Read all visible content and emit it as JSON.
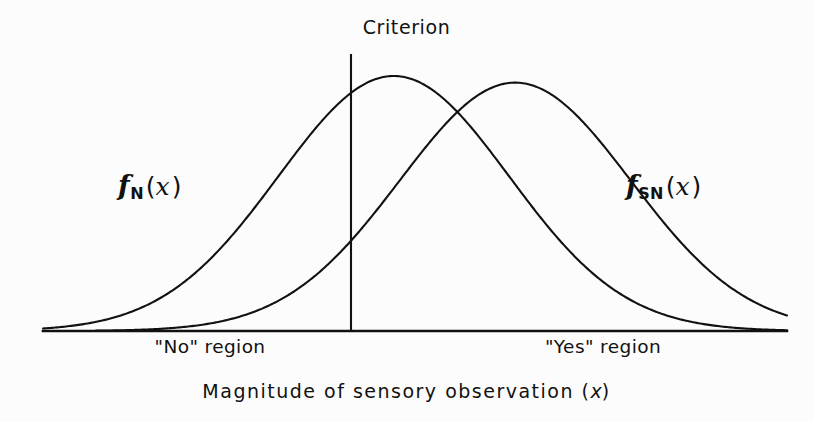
{
  "figure": {
    "background_color": "#fdfcfc",
    "ink_color": "#111111",
    "criterion_label": "Criterion",
    "xaxis_caption_prefix": "Magnitude of sensory observation (",
    "xaxis_caption_variable": "x",
    "xaxis_caption_suffix": ")",
    "no_region_label": "\"No\" region",
    "yes_region_label": "\"Yes\" region",
    "noise_label_f": "f",
    "noise_label_sub": "N",
    "noise_label_open": "(",
    "noise_label_arg": "x",
    "noise_label_close": ")",
    "signal_label_f": "f",
    "signal_label_sub": "SN",
    "signal_label_open": "(",
    "signal_label_arg": "x",
    "signal_label_close": ")"
  },
  "chart_data": {
    "type": "line",
    "title": "",
    "xlabel": "Magnitude of sensory observation (x)",
    "ylabel": "",
    "grid": false,
    "legend_position": "inline-annotation",
    "axis": {
      "x_start_px": 43,
      "x_end_px": 787,
      "baseline_px": 331,
      "top_px": 54,
      "x_domain": [
        -3.4,
        6.4
      ],
      "y_domain": [
        0,
        1.05
      ]
    },
    "annotations": [
      {
        "name": "criterion",
        "label": "Criterion",
        "x_value": 1.6,
        "x_px": 351,
        "line_top_px": 54,
        "line_bottom_px": 331
      },
      {
        "name": "noise-curve-label",
        "label": "fN(x)",
        "x_px": 118,
        "y_px": 172
      },
      {
        "name": "signal-curve-label",
        "label": "fSN(x)",
        "x_px": 626,
        "y_px": 172
      },
      {
        "name": "no-region",
        "label": "\"No\" region",
        "x_px": 210,
        "y_px": 338
      },
      {
        "name": "yes-region",
        "label": "\"Yes\" region",
        "x_px": 603,
        "y_px": 338
      }
    ],
    "series": [
      {
        "name": "fN(x)",
        "description": "Noise-alone probability density (normal distribution)",
        "distribution": "gaussian",
        "mean": 1.22,
        "sigma": 1.52,
        "peak_px": {
          "x": 330,
          "y": 88
        },
        "tail_left_px": 45,
        "tail_right_px": 648,
        "amplitude": 1.0
      },
      {
        "name": "fSN(x)",
        "description": "Signal-plus-noise probability density (normal distribution)",
        "distribution": "gaussian",
        "mean": 2.82,
        "sigma": 1.52,
        "peak_px": {
          "x": 452,
          "y": 95
        },
        "tail_left_px": 160,
        "tail_right_px": 784,
        "amplitude": 0.974
      }
    ],
    "intersection_px": {
      "x": 390,
      "y": 122
    }
  }
}
